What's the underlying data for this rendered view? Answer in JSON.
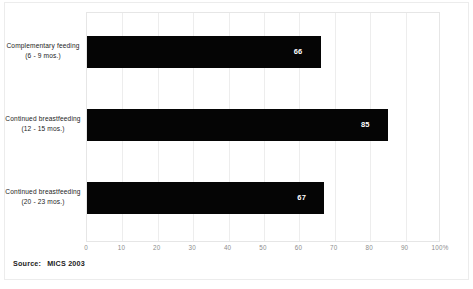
{
  "chart_data": {
    "type": "bar",
    "orientation": "horizontal",
    "title": "",
    "subtitle": "",
    "xlabel": "",
    "ylabel": "",
    "categories": [
      "Complementary feeding (6 - 9 mos.)",
      "Continued breastfeeding (12 - 15 mos.)",
      "Continued breastfeeding (20 - 23 mos.)"
    ],
    "category_lines": [
      [
        "Complementary feeding",
        "(6 - 9 mos.)"
      ],
      [
        "Continued breastfeeding",
        "(12 - 15 mos.)"
      ],
      [
        "Continued breastfeeding",
        "(20 - 23 mos.)"
      ]
    ],
    "values": [
      66,
      85,
      67
    ],
    "value_labels": [
      "66",
      "85",
      "67"
    ],
    "xlim": [
      0,
      100
    ],
    "xticks": [
      0,
      10,
      20,
      30,
      40,
      50,
      60,
      70,
      80,
      90,
      100
    ],
    "xtick_labels": [
      "0",
      "10",
      "20",
      "30",
      "40",
      "50",
      "60",
      "70",
      "80",
      "90",
      "100%"
    ],
    "grid": true,
    "grid_axis": "x",
    "legend": false,
    "bar_color": "#050505",
    "value_label_color": "#ffffff",
    "grid_color": "#ededed",
    "axis_text_color": "#8d8d8d"
  },
  "source": {
    "key": "Source:",
    "value": "MICS 2003"
  }
}
